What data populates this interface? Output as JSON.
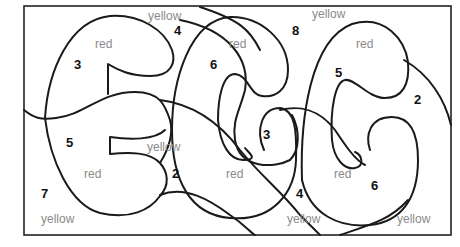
{
  "worksheet": {
    "title": "EGG color-by-number",
    "word_labels": [
      {
        "id": "yellow-top-left",
        "text": "yellow"
      },
      {
        "id": "yellow-top-right",
        "text": "yellow"
      },
      {
        "id": "red-e-top",
        "text": "red"
      },
      {
        "id": "red-g1-top",
        "text": "red"
      },
      {
        "id": "red-g2-top",
        "text": "red"
      },
      {
        "id": "yellow-e-middle",
        "text": "yellow"
      },
      {
        "id": "red-e-bottom",
        "text": "red"
      },
      {
        "id": "red-g1-bottom",
        "text": "red"
      },
      {
        "id": "red-g2-bottom",
        "text": "red"
      },
      {
        "id": "yellow-bottom-left",
        "text": "yellow"
      },
      {
        "id": "yellow-bottom-middle",
        "text": "yellow"
      },
      {
        "id": "yellow-bottom-right",
        "text": "yellow"
      }
    ],
    "number_labels": [
      {
        "id": "num-3-e-top",
        "text": "3"
      },
      {
        "id": "num-4-top",
        "text": "4"
      },
      {
        "id": "num-6-g1-top",
        "text": "6"
      },
      {
        "id": "num-8-top",
        "text": "8"
      },
      {
        "id": "num-5-g2-top",
        "text": "5"
      },
      {
        "id": "num-2-right",
        "text": "2"
      },
      {
        "id": "num-5-e-bottom",
        "text": "5"
      },
      {
        "id": "num-3-g1-middle",
        "text": "3"
      },
      {
        "id": "num-2-e-middle",
        "text": "2"
      },
      {
        "id": "num-7-left",
        "text": "7"
      },
      {
        "id": "num-4-bottom",
        "text": "4"
      },
      {
        "id": "num-6-g2-bottom",
        "text": "6"
      }
    ]
  }
}
